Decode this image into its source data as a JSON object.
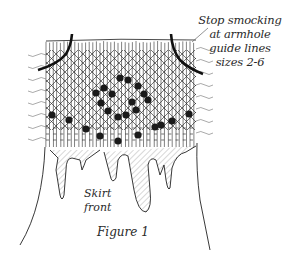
{
  "figure": {
    "caption": "Figure 1",
    "annotation_lines": [
      "Stop smocking",
      "at armhole",
      "guide lines",
      "sizes 2-6"
    ],
    "skirt_label_lines": [
      "Skirt",
      "front"
    ],
    "colors": {
      "ink": "#1a1a1a",
      "paper": "#ffffff",
      "hatch": "#555555"
    },
    "elements": {
      "pleat_grid": "vertical pleat lines with diagonal smocking lattice",
      "dots": "filled smocking knots in diamond / wave pattern",
      "armhole_curves": "two bold curved guide lines at upper left and right",
      "skirt": "skirt panel with hatched folds hanging below pleats"
    }
  }
}
